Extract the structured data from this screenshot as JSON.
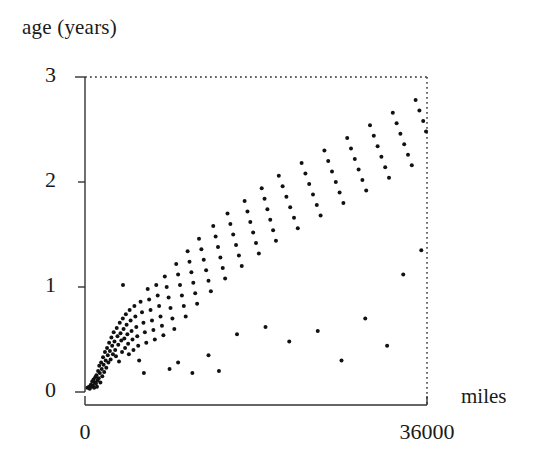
{
  "chart_data": {
    "type": "scatter",
    "title": "",
    "xlabel": "miles",
    "ylabel": "age (years)",
    "xlim": [
      0,
      36000
    ],
    "ylim": [
      0,
      3
    ],
    "xticks": [
      0,
      36000
    ],
    "xtick_labels": [
      "0",
      "36000"
    ],
    "yticks": [
      0,
      1,
      2,
      3
    ],
    "ytick_labels": [
      "0",
      "1",
      "2",
      "3"
    ],
    "grid": false,
    "legend": null,
    "marker": {
      "shape": "circle",
      "color": "#111111",
      "size_px": 4
    },
    "spine_style": {
      "left": "solid-bracket",
      "bottom": "solid-bracket",
      "top": "dotted",
      "right": "dotted",
      "color": "#333333"
    },
    "n_points": 190,
    "points": [
      [
        250,
        0.04
      ],
      [
        420,
        0.05
      ],
      [
        500,
        0.03
      ],
      [
        620,
        0.07
      ],
      [
        700,
        0.05
      ],
      [
        760,
        0.1
      ],
      [
        840,
        0.06
      ],
      [
        900,
        0.12
      ],
      [
        960,
        0.04
      ],
      [
        1020,
        0.09
      ],
      [
        1080,
        0.14
      ],
      [
        1150,
        0.08
      ],
      [
        1200,
        0.16
      ],
      [
        1260,
        0.05
      ],
      [
        1320,
        0.11
      ],
      [
        1380,
        0.2
      ],
      [
        1440,
        0.13
      ],
      [
        1500,
        0.25
      ],
      [
        1560,
        0.18
      ],
      [
        1620,
        0.09
      ],
      [
        1700,
        0.28
      ],
      [
        1760,
        0.22
      ],
      [
        1820,
        0.15
      ],
      [
        1900,
        0.33
      ],
      [
        1960,
        0.26
      ],
      [
        2020,
        0.19
      ],
      [
        2100,
        0.38
      ],
      [
        2180,
        0.3
      ],
      [
        2240,
        0.23
      ],
      [
        2320,
        0.42
      ],
      [
        2400,
        0.35
      ],
      [
        2460,
        0.28
      ],
      [
        2540,
        0.47
      ],
      [
        2620,
        0.39
      ],
      [
        2700,
        0.31
      ],
      [
        2780,
        0.52
      ],
      [
        2860,
        0.44
      ],
      [
        2940,
        0.36
      ],
      [
        3020,
        0.57
      ],
      [
        3100,
        0.48
      ],
      [
        3180,
        0.4
      ],
      [
        3260,
        0.34
      ],
      [
        3340,
        0.61
      ],
      [
        3420,
        0.53
      ],
      [
        3500,
        0.45
      ],
      [
        3580,
        0.29
      ],
      [
        3660,
        0.66
      ],
      [
        3740,
        0.56
      ],
      [
        3820,
        0.49
      ],
      [
        3900,
        0.38
      ],
      [
        3980,
        0.7
      ],
      [
        4060,
        0.6
      ],
      [
        4140,
        0.51
      ],
      [
        4220,
        0.42
      ],
      [
        4300,
        0.74
      ],
      [
        4380,
        0.64
      ],
      [
        4460,
        0.55
      ],
      [
        4540,
        0.46
      ],
      [
        4620,
        0.36
      ],
      [
        4700,
        0.78
      ],
      [
        4800,
        0.68
      ],
      [
        4900,
        0.58
      ],
      [
        5000,
        0.5
      ],
      [
        5100,
        0.4
      ],
      [
        5200,
        0.82
      ],
      [
        5300,
        0.72
      ],
      [
        5400,
        0.62
      ],
      [
        5500,
        0.53
      ],
      [
        5600,
        0.44
      ],
      [
        5700,
        0.3
      ],
      [
        5850,
        0.86
      ],
      [
        6000,
        0.76
      ],
      [
        6150,
        0.66
      ],
      [
        6300,
        0.57
      ],
      [
        6450,
        0.47
      ],
      [
        6600,
        0.98
      ],
      [
        6750,
        0.88
      ],
      [
        6900,
        0.78
      ],
      [
        7050,
        0.68
      ],
      [
        7200,
        0.59
      ],
      [
        7350,
        0.5
      ],
      [
        7500,
        1.02
      ],
      [
        7650,
        0.92
      ],
      [
        7800,
        0.82
      ],
      [
        7950,
        0.72
      ],
      [
        8100,
        0.63
      ],
      [
        8250,
        0.54
      ],
      [
        8400,
        1.1
      ],
      [
        8600,
        1.0
      ],
      [
        8800,
        0.9
      ],
      [
        9000,
        0.8
      ],
      [
        9200,
        0.7
      ],
      [
        9400,
        0.6
      ],
      [
        9600,
        1.22
      ],
      [
        9800,
        1.12
      ],
      [
        10000,
        1.02
      ],
      [
        10200,
        0.92
      ],
      [
        10400,
        0.82
      ],
      [
        10600,
        0.72
      ],
      [
        10800,
        1.34
      ],
      [
        11000,
        1.24
      ],
      [
        11200,
        1.14
      ],
      [
        11400,
        1.04
      ],
      [
        11600,
        0.94
      ],
      [
        11800,
        0.84
      ],
      [
        12000,
        1.46
      ],
      [
        12250,
        1.36
      ],
      [
        12500,
        1.26
      ],
      [
        12750,
        1.16
      ],
      [
        13000,
        1.06
      ],
      [
        13250,
        0.96
      ],
      [
        13500,
        1.58
      ],
      [
        13750,
        1.48
      ],
      [
        14000,
        1.38
      ],
      [
        14250,
        1.28
      ],
      [
        14500,
        1.18
      ],
      [
        14750,
        1.08
      ],
      [
        15000,
        1.7
      ],
      [
        15300,
        1.6
      ],
      [
        15600,
        1.5
      ],
      [
        15900,
        1.4
      ],
      [
        16200,
        1.3
      ],
      [
        16500,
        1.2
      ],
      [
        16800,
        1.82
      ],
      [
        17100,
        1.72
      ],
      [
        17400,
        1.62
      ],
      [
        17700,
        1.52
      ],
      [
        18000,
        1.42
      ],
      [
        18300,
        1.32
      ],
      [
        18600,
        1.94
      ],
      [
        18900,
        1.84
      ],
      [
        19200,
        1.74
      ],
      [
        19500,
        1.64
      ],
      [
        19800,
        1.54
      ],
      [
        20100,
        1.44
      ],
      [
        20400,
        2.06
      ],
      [
        20800,
        1.96
      ],
      [
        21200,
        1.86
      ],
      [
        21600,
        1.76
      ],
      [
        22000,
        1.66
      ],
      [
        22400,
        1.56
      ],
      [
        22800,
        2.18
      ],
      [
        23200,
        2.08
      ],
      [
        23600,
        1.98
      ],
      [
        24000,
        1.88
      ],
      [
        24400,
        1.78
      ],
      [
        24800,
        1.68
      ],
      [
        25200,
        2.3
      ],
      [
        25600,
        2.2
      ],
      [
        26000,
        2.1
      ],
      [
        26400,
        2.0
      ],
      [
        26800,
        1.9
      ],
      [
        27200,
        1.8
      ],
      [
        27600,
        2.42
      ],
      [
        28000,
        2.32
      ],
      [
        28400,
        2.22
      ],
      [
        28800,
        2.12
      ],
      [
        29200,
        2.02
      ],
      [
        29600,
        1.92
      ],
      [
        30000,
        2.54
      ],
      [
        30400,
        2.44
      ],
      [
        30800,
        2.34
      ],
      [
        31200,
        2.24
      ],
      [
        31600,
        2.14
      ],
      [
        32000,
        2.04
      ],
      [
        32400,
        2.66
      ],
      [
        32800,
        2.56
      ],
      [
        33200,
        2.46
      ],
      [
        33600,
        2.36
      ],
      [
        34000,
        2.26
      ],
      [
        34400,
        2.16
      ],
      [
        34800,
        2.78
      ],
      [
        35200,
        2.68
      ],
      [
        35600,
        2.58
      ],
      [
        35900,
        2.48
      ],
      [
        8900,
        0.22
      ],
      [
        11300,
        0.18
      ],
      [
        14100,
        0.2
      ],
      [
        16000,
        0.55
      ],
      [
        19000,
        0.62
      ],
      [
        21500,
        0.48
      ],
      [
        24500,
        0.58
      ],
      [
        27000,
        0.3
      ],
      [
        29500,
        0.7
      ],
      [
        31800,
        0.44
      ],
      [
        33500,
        1.12
      ],
      [
        35400,
        1.35
      ],
      [
        4000,
        1.02
      ],
      [
        6200,
        0.18
      ],
      [
        9800,
        0.28
      ],
      [
        13000,
        0.35
      ]
    ]
  },
  "axes": {
    "ylabel": "age (years)",
    "xlabel": "miles",
    "ytick_labels": [
      "0",
      "1",
      "2",
      "3"
    ],
    "xtick_labels": [
      "0",
      "36000"
    ]
  }
}
